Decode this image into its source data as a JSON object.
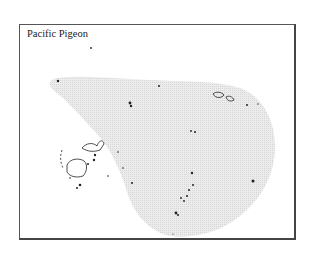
{
  "map": {
    "title": "Pacific Pigeon",
    "range_fill_color": "#e6e6e6",
    "island_color": "#222222",
    "frame_color": "#555555",
    "legend": []
  }
}
